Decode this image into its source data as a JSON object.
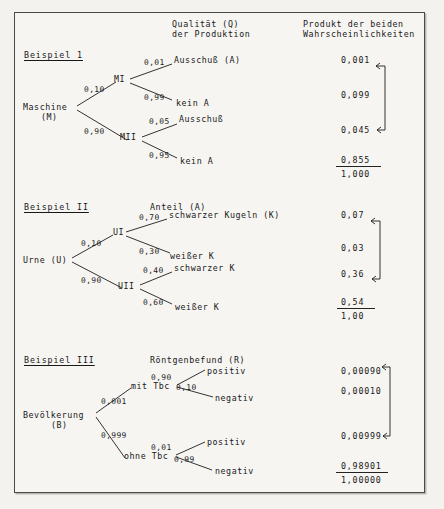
{
  "page": {
    "column_headers": [
      {
        "line1": "Qualität (Q)",
        "line2": "der Produktion"
      },
      {
        "line1": "Produkt der beiden",
        "line2": "Wahrscheinlichkeiten"
      }
    ]
  },
  "examples": [
    {
      "title": "Beispiel 1",
      "root_line1": "Maschine",
      "root_line2": "(M)",
      "node_upper": "MI",
      "node_lower": "MII",
      "p_upper": "0,10",
      "p_lower": "0,90",
      "leaves": [
        {
          "prob": "0,01",
          "label": "Ausschuß (A)",
          "product": "0,001"
        },
        {
          "prob": "0,99",
          "label": "kein A",
          "product": "0,099"
        },
        {
          "prob": "0,05",
          "label": "Ausschuß",
          "product": "0,045"
        },
        {
          "prob": "0,95",
          "label": "kein A",
          "product": "0,855"
        }
      ],
      "total": "1,000"
    },
    {
      "title": "Beispiel II",
      "header": "Anteil (A)",
      "root_line1": "Urne (U)",
      "root_line2": "",
      "node_upper": "UI",
      "node_lower": "UII",
      "p_upper": "0,10",
      "p_lower": "0,90",
      "leaves": [
        {
          "prob": "0,70",
          "label": "schwarzer Kugeln (K)",
          "product": "0,07"
        },
        {
          "prob": "0,30",
          "label": "weißer K",
          "product": "0,03"
        },
        {
          "prob": "0,40",
          "label": "schwarzer K",
          "product": "0,36"
        },
        {
          "prob": "0,60",
          "label": "weißer K",
          "product": "0,54"
        }
      ],
      "total": "1,00"
    },
    {
      "title": "Beispiel III",
      "header": "Röntgenbefund (R)",
      "root_line1": "Bevölkerung",
      "root_line2": "(B)",
      "node_upper": "mit Tbc",
      "node_lower": "ohne Tbc",
      "p_upper": "0,001",
      "p_lower": "0,999",
      "leaves": [
        {
          "prob": "0,90",
          "label": "positiv",
          "product": "0,00090"
        },
        {
          "prob": "0,10",
          "label": "negativ",
          "product": "0,00010"
        },
        {
          "prob": "0,01",
          "label": "positiv",
          "product": "0,00999"
        },
        {
          "prob": "0,99",
          "label": "negativ",
          "product": "0,98901"
        }
      ],
      "total": "1,00000"
    }
  ]
}
